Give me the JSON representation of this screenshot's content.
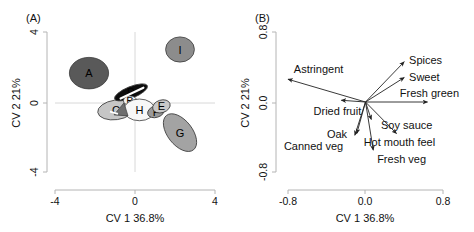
{
  "figure": {
    "caption_panels": [
      "(A)",
      "(B)"
    ],
    "background": "#ffffff",
    "axis_color": "#b4b4b4",
    "grid_color": "#d8d8d8",
    "vector_color": "#222222"
  },
  "panel_a": {
    "tag": "(A)",
    "xlabel": "CV 1 36.8%",
    "ylabel": "CV 2 21%",
    "xticks": [
      "-4",
      "0",
      "4"
    ],
    "yticks": [
      "4",
      "0",
      "-4"
    ],
    "xlim": [
      -4,
      4
    ],
    "ylim": [
      -4,
      4
    ]
  },
  "panel_b": {
    "tag": "(B)",
    "xlabel": "CV 1 36.8%",
    "ylabel": "CV 2 21%",
    "xticks": [
      "-0.8",
      "0.0",
      "0.8"
    ],
    "yticks": [
      "0.8",
      "0.0",
      "-0.8"
    ],
    "xlim": [
      -0.8,
      0.8
    ],
    "ylim": [
      -0.8,
      0.8
    ]
  },
  "chart_data": [
    {
      "type": "scatter",
      "title": "(A)",
      "subtitle": "Canonical variate scores with 95% confidence ellipses",
      "xlabel": "CV 1 36.8%",
      "ylabel": "CV 2 21%",
      "xlim": [
        -4,
        4
      ],
      "ylim": [
        -4,
        4
      ],
      "xticks": [
        -4,
        0,
        4
      ],
      "yticks": [
        -4,
        0,
        4
      ],
      "grid": true,
      "legend": "none",
      "ellipses": [
        {
          "label": "A",
          "cx": -2.3,
          "cy": 1.65,
          "rx": 0.98,
          "ry": 0.9,
          "angle": 0,
          "fill": "#595959",
          "label_color": "#000000"
        },
        {
          "label": "I",
          "cx": 2.25,
          "cy": 3.0,
          "rx": 0.72,
          "ry": 0.72,
          "angle": 0,
          "fill": "#8c8c8c",
          "label_color": "#000000"
        },
        {
          "label": "C",
          "cx": -0.95,
          "cy": -0.45,
          "rx": 0.92,
          "ry": 0.56,
          "angle": -8,
          "fill": "#c6c6c6",
          "label_color": "#000000"
        },
        {
          "label": "D",
          "cx": -0.2,
          "cy": 0.55,
          "rx": 0.88,
          "ry": 0.33,
          "angle": -22,
          "fill": "#0d0d0d",
          "label_color": "#ffffff"
        },
        {
          "label": "B",
          "cx": -0.25,
          "cy": 0.08,
          "rx": 0.33,
          "ry": 0.27,
          "angle": 0,
          "fill": "#f2f2f2",
          "label_color": "#000000"
        },
        {
          "label": "H",
          "cx": 0.22,
          "cy": -0.45,
          "rx": 0.78,
          "ry": 0.62,
          "angle": 0,
          "fill": "#f7f7f7",
          "label_color": "#000000"
        },
        {
          "label": "F",
          "cx": 1.05,
          "cy": -0.55,
          "rx": 0.43,
          "ry": 0.33,
          "angle": -18,
          "fill": "#9a9a9a",
          "label_color": "#000000"
        },
        {
          "label": "E",
          "cx": 1.32,
          "cy": -0.25,
          "rx": 0.45,
          "ry": 0.36,
          "angle": -18,
          "fill": "#c9c9c9",
          "label_color": "#000000"
        },
        {
          "label": "G",
          "cx": 2.25,
          "cy": -1.75,
          "rx": 0.62,
          "ry": 1.25,
          "angle": -38,
          "fill": "#a3a3a3",
          "label_color": "#000000"
        }
      ]
    },
    {
      "type": "scatter",
      "title": "(B)",
      "subtitle": "Sensory attribute loading vectors",
      "xlabel": "CV 1 36.8%",
      "ylabel": "CV 2 21%",
      "xlim": [
        -0.8,
        0.8
      ],
      "ylim": [
        -0.8,
        0.8
      ],
      "xticks": [
        -0.8,
        0.0,
        0.8
      ],
      "yticks": [
        -0.8,
        0.0,
        0.8
      ],
      "grid": false,
      "legend": "none",
      "vectors": [
        {
          "label": "Astringent",
          "x": -0.8,
          "y": 0.26,
          "label_dx": 0.06,
          "label_dy": 0.12,
          "anchor": "start"
        },
        {
          "label": "Dried fruit",
          "x": -0.25,
          "y": 0.02,
          "label_dx": -0.04,
          "label_dy": -0.12,
          "anchor": "middle"
        },
        {
          "label": "Spices",
          "x": 0.4,
          "y": 0.46,
          "label_dx": 0.05,
          "label_dy": 0.02,
          "anchor": "start"
        },
        {
          "label": "Sweet",
          "x": 0.4,
          "y": 0.28,
          "label_dx": 0.05,
          "label_dy": 0.01,
          "anchor": "start"
        },
        {
          "label": "Fresh green",
          "x": 0.64,
          "y": 0.0,
          "label_dx": 0.02,
          "label_dy": 0.1,
          "anchor": "middle"
        },
        {
          "label": "Soy sauce",
          "x": 0.06,
          "y": -0.2,
          "label_dx": 0.1,
          "label_dy": -0.06,
          "anchor": "start"
        },
        {
          "label": "Oak",
          "x": -0.09,
          "y": -0.36,
          "label_dx": -0.1,
          "label_dy": -0.01,
          "anchor": "end"
        },
        {
          "label": "Canned veg",
          "x": -0.11,
          "y": -0.38,
          "label_dx": -0.12,
          "label_dy": -0.12,
          "anchor": "end"
        },
        {
          "label": "Hot mouth feel",
          "x": 0.32,
          "y": -0.36,
          "label_dx": 0.03,
          "label_dy": -0.1,
          "anchor": "middle"
        },
        {
          "label": "Fresh veg",
          "x": 0.08,
          "y": -0.55,
          "label_dx": 0.04,
          "label_dy": -0.1,
          "anchor": "start"
        }
      ]
    }
  ]
}
